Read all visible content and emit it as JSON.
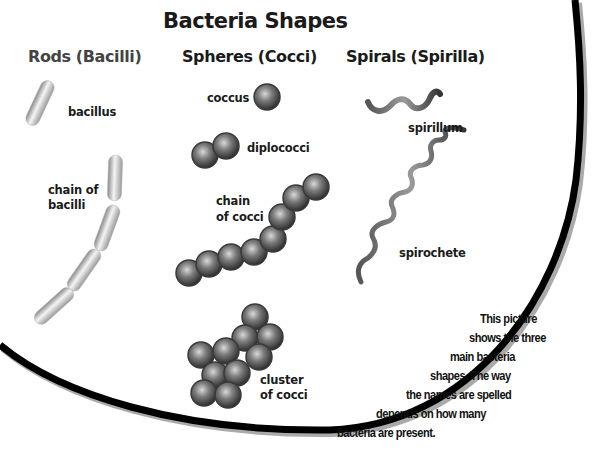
{
  "title": "Bacteria Shapes",
  "categories": [
    {
      "id": "rods",
      "heading": "Rods (Bacilli)",
      "items": [
        {
          "label": "bacillus"
        },
        {
          "label_line1": "chain of",
          "label_line2": "bacilli"
        }
      ]
    },
    {
      "id": "spheres",
      "heading": "Spheres (Cocci)",
      "items": [
        {
          "label": "coccus"
        },
        {
          "label": "diplococci"
        },
        {
          "label_line1": "chain",
          "label_line2": "of cocci"
        },
        {
          "label_line1": "cluster",
          "label_line2": "of cocci"
        }
      ]
    },
    {
      "id": "spirals",
      "heading": "Spirals (Spirilla)",
      "items": [
        {
          "label": "spirillum"
        },
        {
          "label": "spirochete"
        }
      ]
    }
  ],
  "note": {
    "lines": [
      "This picture",
      "shows the three",
      "main bacteria",
      "shapes. The way",
      "the names are spelled",
      "depends on how many",
      "bacteria are present."
    ]
  },
  "colors": {
    "background": "#ffffff",
    "border": "#000000",
    "text": "#1a1a1a",
    "sphere": "#6e6e6e",
    "rod": "#bdbdbd"
  }
}
